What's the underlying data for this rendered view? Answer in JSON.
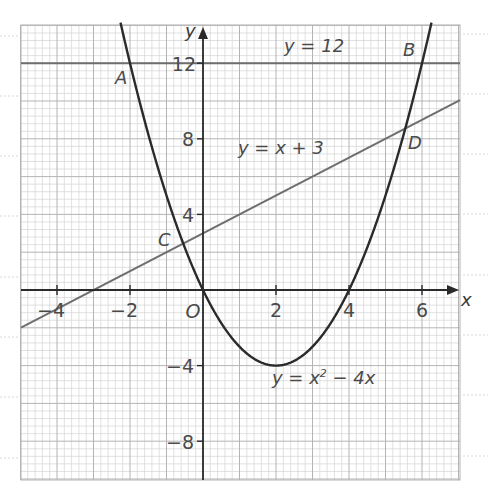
{
  "chart_data": {
    "type": "line",
    "title": "",
    "xlabel": "x",
    "ylabel": "y",
    "xlim": [
      -5,
      7
    ],
    "ylim": [
      -10,
      14
    ],
    "grid": true,
    "x_ticks": [
      -4,
      -2,
      0,
      2,
      4,
      6
    ],
    "x_tick_labels": [
      "−4",
      "−2",
      "O",
      "2",
      "4",
      "6"
    ],
    "y_ticks": [
      12,
      8,
      4,
      -4,
      -8
    ],
    "y_tick_labels": [
      "12",
      "8",
      "4",
      "−4",
      "−8"
    ],
    "series": [
      {
        "name": "y = x² − 4x",
        "kind": "parabola",
        "equation": "y = x^2 - 4x",
        "color": "#2a2a2a",
        "x": [
          -2.2,
          -2,
          -1,
          0,
          1,
          2,
          3,
          4,
          5,
          6,
          6.2
        ],
        "y": [
          13.64,
          12,
          5,
          0,
          -3,
          -4,
          -3,
          0,
          5,
          12,
          13.64
        ]
      },
      {
        "name": "y = 12",
        "kind": "horizontal-line",
        "equation": "y = 12",
        "color": "#6e6e6e",
        "x": [
          -5,
          7
        ],
        "y": [
          12,
          12
        ]
      },
      {
        "name": "y = x + 3",
        "kind": "line",
        "equation": "y = x + 3",
        "color": "#6e6e6e",
        "x": [
          -5,
          7
        ],
        "y": [
          -2,
          10
        ]
      }
    ],
    "points": [
      {
        "label": "A",
        "x": -2,
        "y": 12
      },
      {
        "label": "B",
        "x": 6,
        "y": 12
      },
      {
        "label": "C",
        "x": -0.54,
        "y": 2.46
      },
      {
        "label": "D",
        "x": 5.54,
        "y": 8.54
      }
    ],
    "annotations": [
      {
        "text": "y = 12",
        "near": "horizontal line, right of y-axis"
      },
      {
        "text": "y = x + 3",
        "near": "slanted line, above D"
      },
      {
        "text": "y = x² − 4x",
        "near": "below vertex of parabola"
      }
    ]
  },
  "labels": {
    "axis_x": "x",
    "axis_y": "y",
    "origin": "O",
    "point_a": "A",
    "point_b": "B",
    "point_c": "C",
    "point_d": "D",
    "eq_horizontal": "y = 12",
    "eq_line": "y = x + 3",
    "eq_parabola_prefix": "y = x",
    "eq_parabola_exp": "2",
    "eq_parabola_suffix": " − 4x",
    "tick_x_m4": "−4",
    "tick_x_m2": "−2",
    "tick_x_2": "2",
    "tick_x_4": "4",
    "tick_x_6": "6",
    "tick_y_12": "12",
    "tick_y_8": "8",
    "tick_y_4": "4",
    "tick_y_m4": "−4",
    "tick_y_m8": "−8"
  },
  "colors": {
    "grid_minor": "#d4d4d4",
    "grid_major": "#b4b4b4",
    "axis": "#2a2a2a",
    "curve": "#2a2a2a",
    "lines": "#6e6e6e",
    "text": "#4a4a4a",
    "margin_rules": "#d8d8d8"
  }
}
